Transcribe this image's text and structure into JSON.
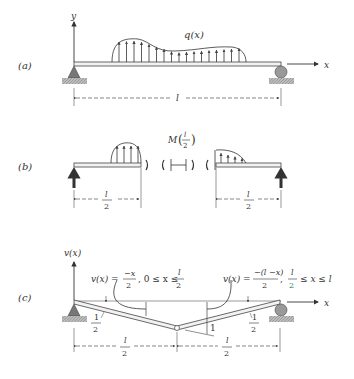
{
  "panels": {
    "a": {
      "label": "(a)",
      "y_axis": "y",
      "x_axis": "x",
      "load": "q(x)",
      "span": "l"
    },
    "b": {
      "label": "(b)",
      "moment_M": "M",
      "moment_num": "l",
      "moment_den": "2",
      "left_span_num": "l",
      "left_span_den": "2",
      "right_span_num": "l",
      "right_span_den": "2"
    },
    "c": {
      "label": "(c)",
      "y_axis": "v(x)",
      "x_axis": "x",
      "eq_left_lhs": "v(x) =",
      "eq_left_num": "−x",
      "eq_left_den": "2",
      "eq_left_cond": ", 0 ≤ x ≤",
      "eq_left_cond_num": "l",
      "eq_left_cond_den": "2",
      "eq_right_lhs": "v(x) =",
      "eq_right_num": "−(l −x)",
      "eq_right_den": "2",
      "eq_right_sep": ",",
      "eq_right_cond_num": "l",
      "eq_right_cond_den": "2",
      "eq_right_cond": "≤ x ≤ l",
      "slope_left_num": "1",
      "slope_left_den": "2",
      "slope_right_num": "1",
      "slope_right_den": "2",
      "unit_deflection": "1",
      "left_span_num": "l",
      "left_span_den": "2",
      "right_span_num": "l",
      "right_span_den": "2"
    }
  }
}
